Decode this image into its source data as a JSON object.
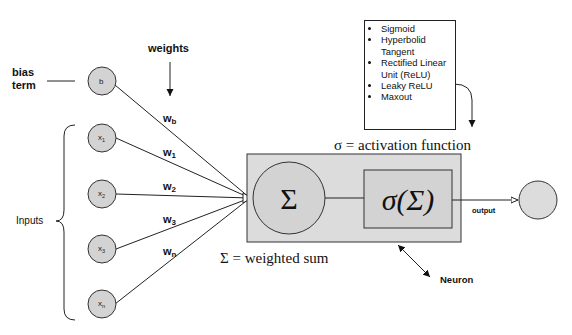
{
  "diagram": {
    "labels": {
      "bias": "bias",
      "term": "term",
      "weights": "weights",
      "inputs": "Inputs",
      "activation": "σ = activation function",
      "weighted_sum": "Σ = weighted sum",
      "output": "output",
      "neuron": "Neuron",
      "sigma_symbol": "Σ",
      "activation_symbol": "σ(Σ)"
    },
    "input_nodes": [
      {
        "id": "b",
        "label": "b"
      },
      {
        "id": "x1",
        "base": "x",
        "sub": "1"
      },
      {
        "id": "x2",
        "base": "x",
        "sub": "2"
      },
      {
        "id": "x3",
        "base": "x",
        "sub": "3"
      },
      {
        "id": "xn",
        "base": "x",
        "sub": "n"
      }
    ],
    "weights": [
      {
        "base": "w",
        "sub": "b"
      },
      {
        "base": "w",
        "sub": "1"
      },
      {
        "base": "w",
        "sub": "2"
      },
      {
        "base": "w",
        "sub": "3"
      },
      {
        "base": "w",
        "sub": "n"
      }
    ],
    "activation_functions": [
      "Sigmoid",
      "Hyperbolid Tangent",
      "Rectified Linear Unit (ReLU)",
      "Leaky ReLU",
      "Maxout"
    ],
    "colors": {
      "node_fill": "#d3d3d3",
      "neuron_box_fill": "#dcdcdc",
      "stroke": "#2a2a2a",
      "text": "#111111"
    }
  }
}
